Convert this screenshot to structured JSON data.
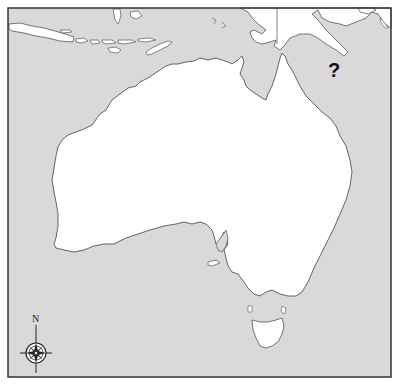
{
  "map": {
    "title": "Outline map of Australia and surrounding region",
    "ocean_color": "#d9d9d9",
    "land_color": "#ffffff",
    "border_color": "#333333",
    "coastline_color": "#555555",
    "regions": [
      {
        "name": "Australia (mainland)",
        "fill": "land"
      },
      {
        "name": "Tasmania",
        "fill": "land"
      },
      {
        "name": "New Guinea",
        "fill": "land"
      },
      {
        "name": "Indonesian islands (Java, Lesser Sunda Islands, Timor)",
        "fill": "land"
      }
    ],
    "annotation": {
      "label": "?",
      "position_hint": "Coral Sea, east of Cape York / south of New Guinea"
    },
    "compass": {
      "north_label": "N",
      "icon": "compass-rose-icon"
    }
  }
}
